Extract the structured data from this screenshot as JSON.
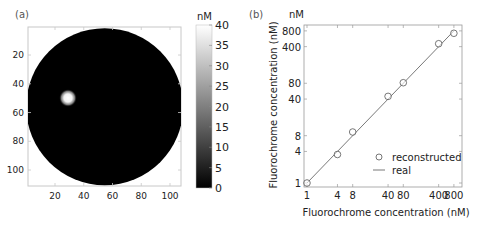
{
  "chart_data": [
    {
      "panel": "(a)",
      "type": "heatmap",
      "title": "",
      "xlabel": "",
      "ylabel": "",
      "x_ticks": [
        20,
        40,
        60,
        80,
        100
      ],
      "y_ticks": [
        20,
        40,
        60,
        80,
        100
      ],
      "xlim": [
        1,
        110
      ],
      "ylim": [
        110,
        1
      ],
      "colorbar": {
        "label": "nM",
        "ticks": [
          0,
          5,
          10,
          15,
          20,
          25,
          30,
          35,
          40
        ],
        "range": [
          0,
          40
        ],
        "colormap": "gray"
      },
      "content": {
        "disk": {
          "center_x": 55,
          "center_y": 55,
          "radius": 54,
          "value": 0
        },
        "inclusion": {
          "center_x": 29,
          "center_y": 49,
          "radius": 4,
          "peak_value": 40
        }
      },
      "grid": false
    },
    {
      "panel": "(b)",
      "type": "scatter",
      "title": "",
      "xlabel": "Fluorochrome concentration (nM)",
      "ylabel": "Fluorochrome concentration (nM)",
      "y_unit_label": "nM",
      "xscale": "log",
      "yscale": "log",
      "x_ticks": [
        1,
        4,
        8,
        40,
        80,
        400,
        800
      ],
      "y_ticks": [
        1,
        4,
        8,
        40,
        80,
        400,
        800
      ],
      "xlim": [
        0.88,
        1050
      ],
      "ylim": [
        0.88,
        1000
      ],
      "series": [
        {
          "name": "reconstructed",
          "style": "open-circle",
          "x": [
            1,
            4,
            8,
            40,
            80,
            400,
            800
          ],
          "y": [
            1,
            3.5,
            9.4,
            45,
            82,
            455,
            720
          ]
        },
        {
          "name": "real",
          "style": "line",
          "x": [
            1,
            800
          ],
          "y": [
            1,
            800
          ]
        }
      ],
      "legend": {
        "position": "lower right",
        "entries": [
          "reconstructed",
          "real"
        ]
      },
      "grid": false
    }
  ],
  "labels": {
    "panel_a": "(a)",
    "panel_b": "(b)",
    "colorbar_unit": "nM",
    "b_unit": "nM",
    "b_xlabel": "Fluorochrome concentration (nM)",
    "b_ylabel": "Fluorochrome concentration (nM)",
    "legend_reconstructed": "reconstructed",
    "legend_real": "real"
  }
}
